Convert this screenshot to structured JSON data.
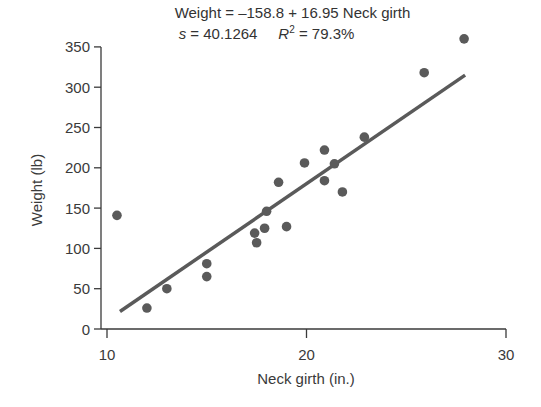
{
  "chart_data": {
    "type": "scatter",
    "title": "Weight = –158.8 + 16.95 Neck girth",
    "subtitle": "s = 40.1264    R² = 79.3%",
    "xlabel": "Neck girth (in.)",
    "ylabel": "Weight (lb)",
    "xlim": [
      9.5,
      30
    ],
    "ylim": [
      0,
      350
    ],
    "xticks": [
      10,
      20,
      30
    ],
    "yticks": [
      0,
      50,
      100,
      150,
      200,
      250,
      300,
      350
    ],
    "grid": false,
    "legend": "none",
    "series": [
      {
        "name": "Observations",
        "x": [
          10.5,
          12.0,
          13.0,
          15.0,
          15.0,
          17.4,
          17.5,
          17.9,
          18.0,
          19.0,
          18.6,
          19.9,
          20.9,
          20.9,
          21.4,
          21.8,
          22.9,
          25.9,
          27.9
        ],
        "y": [
          141,
          26,
          50,
          81,
          65,
          119,
          107,
          125,
          146,
          127,
          182,
          206,
          222,
          184,
          205,
          170,
          238,
          318,
          360
        ]
      }
    ],
    "regression": {
      "intercept": -158.8,
      "slope": 16.95,
      "x_range": [
        10.65,
        27.95
      ],
      "s": 40.1264,
      "r_squared_pct": 79.3
    },
    "colors": {
      "points": "#5a5a5a",
      "line": "#5a5a5a",
      "axis": "#3a3a3a"
    }
  },
  "labels": {
    "title_line1": "Weight = –158.8 + 16.95 Neck girth",
    "s_label": "s",
    "s_value": " = 40.1264",
    "r_label": "R",
    "r_sup": "2",
    "r_value": " = 79.3%"
  }
}
